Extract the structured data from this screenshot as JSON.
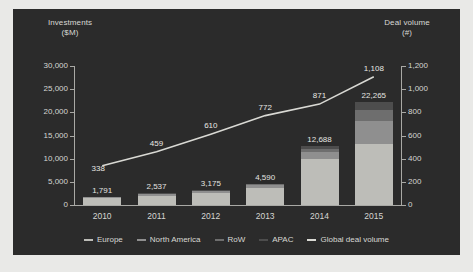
{
  "chart_data": {
    "type": "bar",
    "title": "",
    "categories": [
      "2010",
      "2011",
      "2012",
      "2013",
      "2014",
      "2015"
    ],
    "xlabel": "",
    "ylabel": "Investments ($M)",
    "y2label": "Deal volume (#)",
    "ylim": [
      0,
      30000
    ],
    "y2lim": [
      0,
      1200
    ],
    "yticks": [
      "0",
      "5,000",
      "10,000",
      "15,000",
      "20,000",
      "25,000",
      "30,000"
    ],
    "ytick_values": [
      0,
      5000,
      10000,
      15000,
      20000,
      25000,
      30000
    ],
    "y2ticks": [
      "0",
      "200",
      "400",
      "600",
      "800",
      "1,000",
      "1,200"
    ],
    "y2tick_values": [
      0,
      200,
      400,
      600,
      800,
      1000,
      1200
    ],
    "grid": false,
    "legend_position": "bottom",
    "stacked": true,
    "series": [
      {
        "name": "Europe",
        "color": "#bdbdb8",
        "values": [
          1430,
          2030,
          2530,
          3640,
          9900,
          13100
        ]
      },
      {
        "name": "North America",
        "color": "#8f8f8f",
        "values": [
          230,
          330,
          410,
          600,
          1600,
          5100
        ]
      },
      {
        "name": "RoW",
        "color": "#6e6e6e",
        "values": [
          80,
          110,
          150,
          210,
          560,
          2400
        ]
      },
      {
        "name": "APAC",
        "color": "#4d4d4d",
        "values": [
          51,
          67,
          85,
          140,
          628,
          1665
        ]
      }
    ],
    "bar_totals": [
      1791,
      2537,
      3175,
      4590,
      12688,
      22265
    ],
    "bar_total_labels": [
      "1,791",
      "2,537",
      "3,175",
      "4,590",
      "12,688",
      "22,265"
    ],
    "line": {
      "name": "Global deal volume",
      "color": "#d9d9d4",
      "axis": "right",
      "values": [
        338,
        459,
        610,
        772,
        871,
        1108
      ],
      "labels": [
        "338",
        "459",
        "610",
        "772",
        "871",
        "1,108"
      ]
    }
  },
  "axes": {
    "left_title_line1": "Investments",
    "left_title_line2": "($M)",
    "right_title_line1": "Deal volume",
    "right_title_line2": "(#)"
  },
  "legend": {
    "items": [
      {
        "label": "Europe",
        "color": "#bdbdb8"
      },
      {
        "label": "North America",
        "color": "#8f8f8f"
      },
      {
        "label": "RoW",
        "color": "#6e6e6e"
      },
      {
        "label": "APAC",
        "color": "#4d4d4d"
      },
      {
        "label": "Global deal volume",
        "color": "#d9d9d4"
      }
    ]
  },
  "colors": {
    "background": "#2b2b2b",
    "page": "#e9e9e7",
    "axis": "#a9a9a5",
    "text": "#d8d8d4"
  }
}
